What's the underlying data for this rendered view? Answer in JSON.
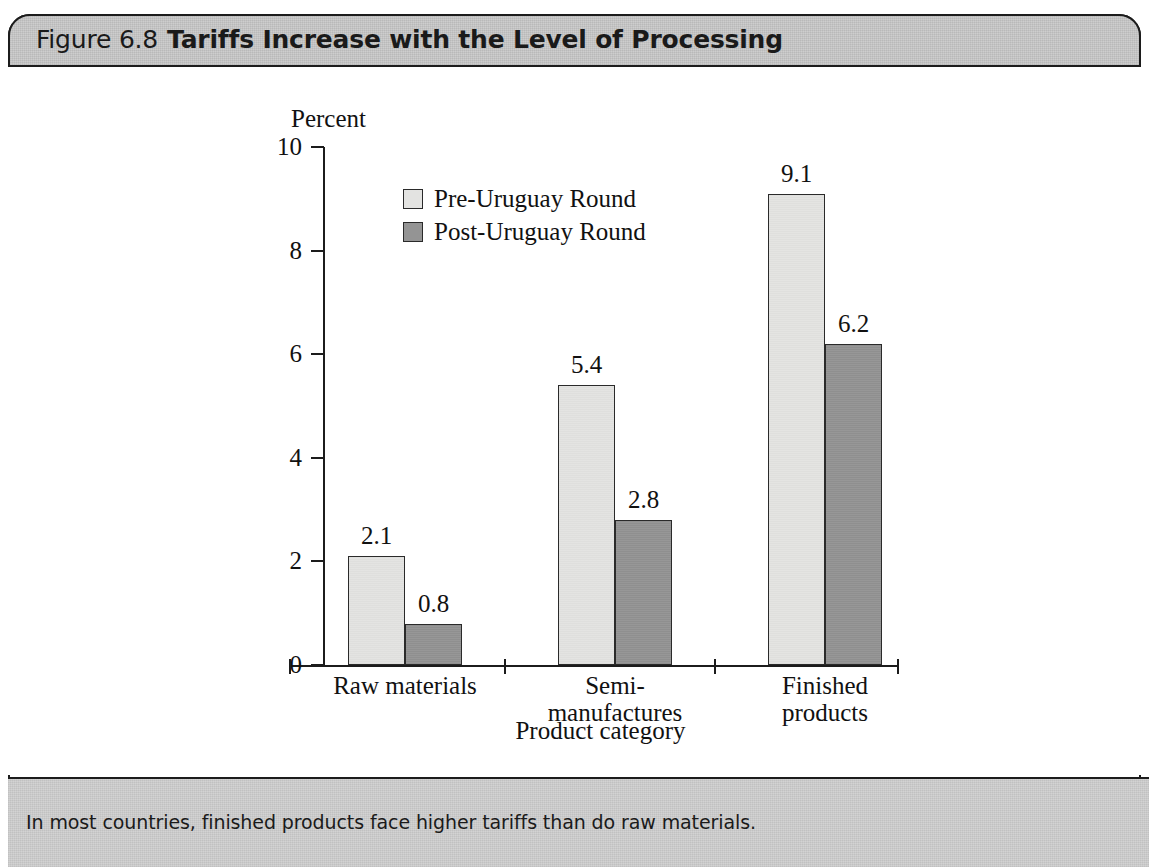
{
  "header": {
    "figure_number": "Figure 6.8",
    "figure_title": "Tariffs Increase with the Level of Processing"
  },
  "caption": {
    "text": "In most countries, finished products face higher tariffs than do raw materials."
  },
  "colors": {
    "pre_round_fill": "#e3e3e1",
    "post_round_fill": "#949494",
    "axis": "#1c1c1c",
    "band": "#c9c9c9",
    "caption_band": "#cfcfcf"
  },
  "chart_data": {
    "type": "bar",
    "title": "Tariffs Increase with the Level of Processing",
    "xlabel": "Product category",
    "ylabel": "Percent",
    "ylim": [
      0,
      10
    ],
    "yticks": [
      0,
      2,
      4,
      6,
      8,
      10
    ],
    "ytick_labels": [
      "0",
      "2",
      "4",
      "6",
      "8",
      "10"
    ],
    "grid": false,
    "legend_position": "upper-left-inside",
    "categories": [
      "Raw materials",
      "Semi-\nmanufactures",
      "Finished\nproducts"
    ],
    "category_labels_flat": [
      "Raw materials",
      "Semi-manufactures",
      "Finished products"
    ],
    "series": [
      {
        "name": "Pre-Uruguay Round",
        "values": [
          2.1,
          5.4,
          9.1
        ],
        "value_labels": [
          "2.1",
          "5.4",
          "9.1"
        ],
        "color": "#e3e3e1"
      },
      {
        "name": "Post-Uruguay Round",
        "values": [
          0.8,
          2.8,
          6.2
        ],
        "value_labels": [
          "0.8",
          "2.8",
          "6.2"
        ],
        "color": "#949494"
      }
    ]
  }
}
